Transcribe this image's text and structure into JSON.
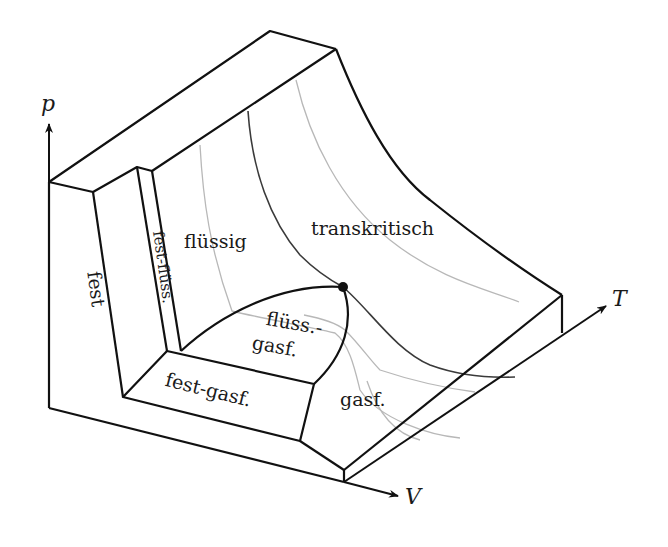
{
  "axes": {
    "p": {
      "label": "p"
    },
    "T": {
      "label": "T"
    },
    "V": {
      "label": "V"
    }
  },
  "regions": {
    "fest": "fest",
    "fest_fluess": "fest-flüss.",
    "fluessig": "flüssig",
    "transkritisch": "transkritisch",
    "fluess_gasf_line1": "flüss.-",
    "fluess_gasf_line2": "gasf.",
    "fest_gasf": "fest-gasf.",
    "gasf": "gasf."
  },
  "markers": {
    "critical_point": {
      "label": "kritischer Punkt",
      "x": 343,
      "y": 287
    }
  },
  "colors": {
    "outline": "#111111",
    "isotherm_dark": "#3a3a3a",
    "isotherm_light": "#b8b8b8",
    "background": "#ffffff"
  }
}
